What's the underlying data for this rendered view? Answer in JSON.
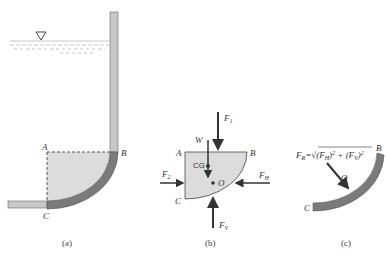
{
  "figure": {
    "panels": [
      {
        "id": "a",
        "caption": "(a)",
        "points": {
          "A": "A",
          "B": "B",
          "C": "C"
        },
        "free_surface_symbol": "▽"
      },
      {
        "id": "b",
        "caption": "(b)",
        "points": {
          "A": "A",
          "B": "B",
          "C": "C",
          "O": "O"
        },
        "cg_label": "CG",
        "forces": {
          "F1": {
            "main": "F",
            "sub": "1"
          },
          "F2": {
            "main": "F",
            "sub": "2"
          },
          "FH": {
            "main": "F",
            "sub": "H"
          },
          "FV": {
            "main": "F",
            "sub": "V"
          },
          "W": "W"
        }
      },
      {
        "id": "c",
        "caption": "(c)",
        "points": {
          "B": "B",
          "C": "C",
          "O": "O"
        },
        "resultant_formula": "F_R = √((F_H)² + (F_V)²)",
        "formula_parts": {
          "lhs_main": "F",
          "lhs_sub": "R",
          "eq": "=",
          "radical": "√",
          "t1_main": "(F",
          "t1_sub": "H",
          "t1_close": ")",
          "sq": "2",
          "plus": "+",
          "t2_main": "(F",
          "t2_sub": "V",
          "t2_close": ")"
        }
      }
    ],
    "colors": {
      "pipe_light": "#c8c8c8",
      "pipe_dark": "#7a7a7a",
      "fluid_fill": "#dcdcdc",
      "arrow": "#333333",
      "water_lines": "#b8b8b8"
    }
  }
}
